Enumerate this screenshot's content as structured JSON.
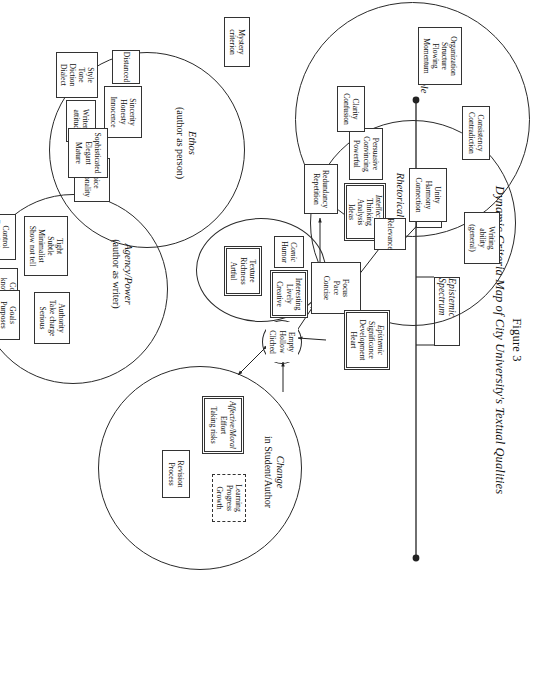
{
  "figure": {
    "number": "Figure 3",
    "title": "Dynamic Criteria Map of City University's Textual Qualities"
  },
  "axis": {
    "label": "Epistemic Spectrum"
  },
  "circles": {
    "change": {
      "label": "Change",
      "sublabel": "in Student/Author"
    },
    "rhetorical": {
      "label": "Rhetorical",
      "sublabel": ""
    },
    "part_to_whole": {
      "label": "Part to Whole",
      "sublabel": ""
    },
    "aesthetic": {
      "label": "Aesthetic",
      "sublabel": ""
    },
    "ethos": {
      "label": "Ethos",
      "sublabel": "(author as person)"
    },
    "agency": {
      "label": "Agency/Power",
      "sublabel": "(author as writer)"
    }
  },
  "nodes": {
    "writing_ability": {
      "lines": [
        "Writing",
        "ability",
        "(general)"
      ]
    },
    "mystery": {
      "lines": [
        "Mystery",
        "criterion"
      ]
    },
    "epistemic_core": {
      "lines": [
        "Epistemic",
        "Significance",
        "Development",
        "Heart"
      ],
      "italic_first": true
    },
    "empty_hollow": {
      "lines": [
        "Empty",
        "Hollow",
        "Cliched"
      ]
    },
    "intellectual": {
      "lines": [
        "Intellectual",
        "Thinking",
        "Analysis",
        "Ideas"
      ],
      "italic_first": true
    },
    "audience": {
      "lines": [
        "Audience",
        "awareness"
      ]
    },
    "persuasive": {
      "lines": [
        "Persuasive",
        "Convincing",
        "Powerful"
      ]
    },
    "consistency": {
      "lines": [
        "Consistency",
        "Contradiction"
      ]
    },
    "unity": {
      "lines": [
        "Unity",
        "Harmony",
        "Connection"
      ]
    },
    "organization": {
      "lines": [
        "Organization",
        "Structure",
        "Flowing",
        "Momentum"
      ]
    },
    "relevance": {
      "lines": [
        "Relevance"
      ]
    },
    "focus": {
      "lines": [
        "Focus",
        "Pace",
        "Concise"
      ]
    },
    "redundancy": {
      "lines": [
        "Redundancy",
        "Repetition"
      ]
    },
    "clarity": {
      "lines": [
        "Clarity",
        "Confusion"
      ]
    },
    "interesting": {
      "lines": [
        "Interesting",
        "Lively",
        "Creative"
      ]
    },
    "comic": {
      "lines": [
        "Comic",
        "Humor"
      ],
      "italic_first": true
    },
    "texture": {
      "lines": [
        "Texture",
        "Richness",
        "Artful"
      ]
    },
    "affective": {
      "lines": [
        "Affective/Moral",
        "Effort",
        "Taking risks"
      ],
      "italic_first": true
    },
    "learning": {
      "lines": [
        "Learning",
        "Progress",
        "Growth"
      ]
    },
    "revision": {
      "lines": [
        "Revision",
        "Process"
      ]
    },
    "sincerity": {
      "lines": [
        "Sincerity",
        "Honesty",
        "Innocence"
      ]
    },
    "distanced": {
      "lines": [
        "Distanced"
      ]
    },
    "writers_attitude": {
      "lines": [
        "Writer's",
        "attitude"
      ]
    },
    "style": {
      "lines": [
        "Style",
        "Tone",
        "Diction",
        "Dialect"
      ]
    },
    "voice": {
      "lines": [
        "Voice",
        "Personality"
      ]
    },
    "sophisticated": {
      "lines": [
        "Sophisticated",
        "Elegant",
        "Mature"
      ]
    },
    "tight": {
      "lines": [
        "Tight",
        "Subtle",
        "Minimalist",
        "Show not tell"
      ]
    },
    "control": {
      "lines": [
        "Control",
        "Boundaries"
      ]
    },
    "competent": {
      "lines": [
        "Competent",
        "knows how to write"
      ]
    },
    "authority": {
      "lines": [
        "Authority",
        "Take charge",
        "Serious"
      ]
    },
    "goals": {
      "lines": [
        "Goals",
        "Purposes",
        "Intentions"
      ]
    }
  },
  "colors": {
    "ink": "#2a2a2a",
    "page": "#ffffff"
  }
}
